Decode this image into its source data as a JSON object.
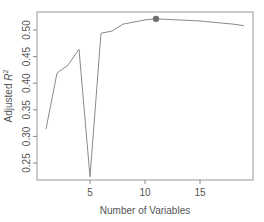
{
  "chart_data": {
    "type": "line",
    "title": "",
    "xlabel": "Number of Variables",
    "ylabel": "Adjusted R²",
    "x": [
      1,
      2,
      3,
      4,
      5,
      6,
      7,
      8,
      9,
      10,
      11,
      12,
      13,
      14,
      15,
      16,
      17,
      18,
      19
    ],
    "series": [
      {
        "name": "Adjusted R²",
        "values": [
          0.314,
          0.419,
          0.434,
          0.464,
          0.224,
          0.494,
          0.498,
          0.511,
          0.515,
          0.519,
          0.521,
          0.52,
          0.519,
          0.518,
          0.517,
          0.515,
          0.513,
          0.511,
          0.508
        ]
      }
    ],
    "highlight": {
      "x": 11,
      "y": 0.521,
      "label": "max"
    },
    "xlim": [
      0.3,
      19.7
    ],
    "ylim": [
      0.215,
      0.535
    ],
    "xticks": [
      5,
      10,
      15
    ],
    "xtick_labels": [
      "5",
      "10",
      "15"
    ],
    "yticks": [
      0.25,
      0.3,
      0.35,
      0.4,
      0.45,
      0.5
    ],
    "ytick_labels": [
      "0.25",
      "0.30",
      "0.35",
      "0.40",
      "0.45",
      "0.50"
    ],
    "grid": false,
    "legend": null
  },
  "colors": {
    "line": "#8a8a8a",
    "point": "#707070",
    "axis": "#888888",
    "text": "#555555"
  }
}
